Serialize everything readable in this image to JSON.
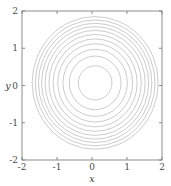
{
  "figure": {
    "background_color": "#ffffff",
    "width": 171,
    "height": 186
  },
  "chart_data": {
    "type": "line",
    "subtype": "contour",
    "title": "",
    "xlabel": "x",
    "ylabel": "y",
    "xlim": [
      -2,
      2
    ],
    "ylim": [
      -2,
      2
    ],
    "grid": false,
    "legend": null,
    "frame": "box",
    "tick_direction": "in",
    "line_color": "#b0b0b0",
    "axis_color": "#808080",
    "xticks": [
      -2,
      -1,
      0,
      1,
      2
    ],
    "xticklabels": [
      "-2",
      "-1",
      "0",
      "1",
      "2"
    ],
    "yticks": [
      -2,
      -1,
      0,
      1,
      2
    ],
    "yticklabels": [
      "-2",
      "-1",
      "0",
      "1",
      "2"
    ],
    "contour_center": [
      0.09,
      0.07
    ],
    "contour_levels": 11,
    "contours": [
      {
        "level": 1,
        "rx": 0.48,
        "ry": 0.46
      },
      {
        "level": 2,
        "rx": 0.74,
        "ry": 0.72
      },
      {
        "level": 3,
        "rx": 0.92,
        "ry": 0.9
      },
      {
        "level": 4,
        "rx": 1.07,
        "ry": 1.05
      },
      {
        "level": 5,
        "rx": 1.2,
        "ry": 1.18
      },
      {
        "level": 6,
        "rx": 1.32,
        "ry": 1.3
      },
      {
        "level": 7,
        "rx": 1.43,
        "ry": 1.41
      },
      {
        "level": 8,
        "rx": 1.53,
        "ry": 1.51
      },
      {
        "level": 9,
        "rx": 1.62,
        "ry": 1.6
      },
      {
        "level": 10,
        "rx": 1.71,
        "ry": 1.69
      },
      {
        "level": 11,
        "rx": 1.8,
        "ry": 1.78
      }
    ]
  }
}
